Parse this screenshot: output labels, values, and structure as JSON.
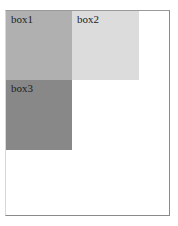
{
  "boxes": [
    {
      "label": "box1",
      "color": "#b0b0b0"
    },
    {
      "label": "box2",
      "color": "#dcdcdc"
    },
    {
      "label": "box3",
      "color": "#888888"
    }
  ],
  "container": {
    "border_color": "#8a8a8a",
    "background": "#ffffff"
  }
}
